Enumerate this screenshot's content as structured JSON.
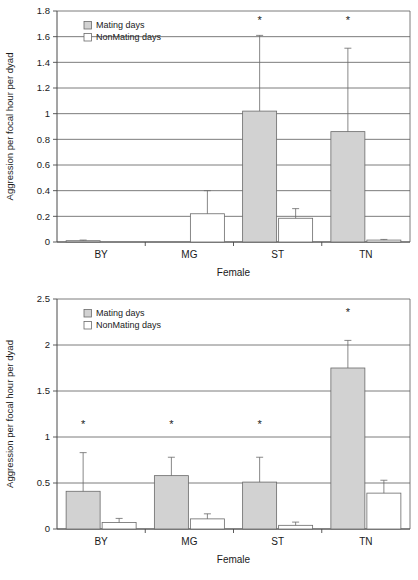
{
  "figure": {
    "panels": [
      "top",
      "bottom"
    ]
  },
  "chart_data": [
    {
      "id": "top",
      "type": "bar",
      "title": "",
      "xlabel": "Female",
      "ylabel": "Aggression per focal hour per dyad",
      "categories": [
        "BY",
        "MG",
        "ST",
        "TN"
      ],
      "ylim": [
        0,
        1.8
      ],
      "yticks": [
        0,
        0.2,
        0.4,
        0.6,
        0.8,
        1,
        1.2,
        1.4,
        1.6,
        1.8
      ],
      "ytick_labels": [
        "0",
        "0.2",
        "0.4",
        "0.6",
        "0.8",
        "1",
        "1.2",
        "1.4",
        "1.6",
        "1.8"
      ],
      "grid": true,
      "legend_position": "top-left",
      "series": [
        {
          "name": "Mating days",
          "color": "#d2d2d2",
          "values": [
            0.01,
            0.0,
            1.02,
            0.86
          ],
          "errors_upper": [
            0.015,
            0.0,
            1.61,
            1.51
          ]
        },
        {
          "name": "NonMating days",
          "color": "#ffffff",
          "values": [
            0.0,
            0.22,
            0.185,
            0.015
          ],
          "errors_upper": [
            0.0,
            0.4,
            0.26,
            0.02
          ]
        }
      ],
      "annotations": [
        {
          "text": "*",
          "category": "ST",
          "y": 1.7
        },
        {
          "text": "*",
          "category": "TN",
          "y": 1.7
        }
      ]
    },
    {
      "id": "bottom",
      "type": "bar",
      "title": "",
      "xlabel": "Female",
      "ylabel": "Aggression per focal hour per dyad",
      "categories": [
        "BY",
        "MG",
        "ST",
        "TN"
      ],
      "ylim": [
        0,
        2.5
      ],
      "yticks": [
        0,
        0.5,
        1,
        1.5,
        2,
        2.5
      ],
      "ytick_labels": [
        "0",
        "0.5",
        "1",
        "1.5",
        "2",
        "2.5"
      ],
      "grid": true,
      "legend_position": "top-left",
      "series": [
        {
          "name": "Mating days",
          "color": "#d2d2d2",
          "values": [
            0.41,
            0.58,
            0.51,
            1.75
          ],
          "errors_upper": [
            0.83,
            0.78,
            0.78,
            2.05
          ]
        },
        {
          "name": "NonMating days",
          "color": "#ffffff",
          "values": [
            0.07,
            0.11,
            0.04,
            0.39
          ],
          "errors_upper": [
            0.115,
            0.165,
            0.075,
            0.53
          ]
        }
      ],
      "annotations": [
        {
          "text": "*",
          "category": "BY",
          "y": 1.1
        },
        {
          "text": "*",
          "category": "MG",
          "y": 1.1
        },
        {
          "text": "*",
          "category": "ST",
          "y": 1.1
        },
        {
          "text": "*",
          "category": "TN",
          "y": 2.31
        }
      ]
    }
  ]
}
